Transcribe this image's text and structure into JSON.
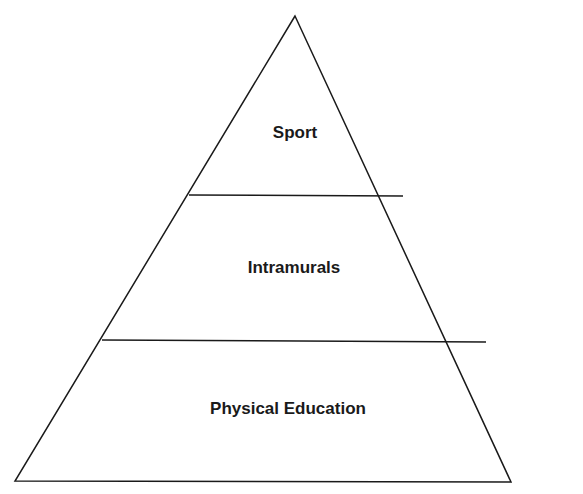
{
  "diagram": {
    "type": "pyramid",
    "line_color": "#1a1a1a",
    "levels": [
      {
        "label": "Sport",
        "position": "top"
      },
      {
        "label": "Intramurals",
        "position": "middle"
      },
      {
        "label": "Physical Education",
        "position": "bottom"
      }
    ]
  }
}
